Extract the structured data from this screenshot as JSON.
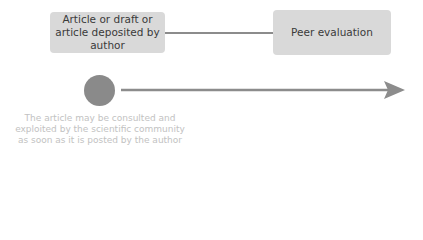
{
  "diagram": {
    "nodes": [
      {
        "id": "deposit",
        "label": "Article or draft or article deposited by author"
      },
      {
        "id": "peer",
        "label": "Peer evaluation"
      }
    ],
    "edges": [
      {
        "from": "deposit",
        "to": "peer",
        "style": "line"
      }
    ],
    "timeline": {
      "marker": "circle",
      "arrow_direction": "right",
      "caption": "The article may be consulted and exploited by the scientific community as soon as it is posted by the author"
    },
    "colors": {
      "box_fill": "#d9d9d9",
      "box_text": "#3a3a3a",
      "line": "#8c8c8c",
      "marker": "#8a8a8a",
      "caption_text": "#c2c2c2"
    }
  }
}
